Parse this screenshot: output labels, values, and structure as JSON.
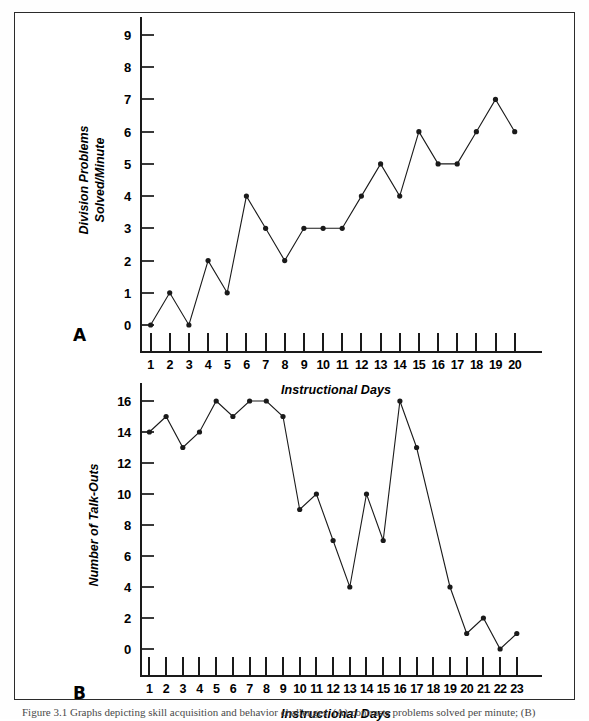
{
  "figure": {
    "caption": "Figure 3.1  Graphs depicting skill acquisition and behavior challenges. (A) contrasts problems solved per minute; (B)"
  },
  "panels": [
    {
      "letter": "A",
      "x_title": "Instructional Days",
      "y_title": "Division Problems Solved/Minute",
      "y_ticks": [
        "0",
        "1",
        "2",
        "3",
        "4",
        "5",
        "6",
        "7",
        "8",
        "9"
      ],
      "x_ticks": [
        "1",
        "2",
        "3",
        "4",
        "5",
        "6",
        "7",
        "8",
        "9",
        "10",
        "11",
        "12",
        "13",
        "14",
        "15",
        "16",
        "17",
        "18",
        "19",
        "20"
      ]
    },
    {
      "letter": "B",
      "x_title": "Instructional Days",
      "y_title": "Number of Talk-Outs",
      "y_ticks": [
        "0",
        "2",
        "4",
        "6",
        "8",
        "10",
        "12",
        "14",
        "16"
      ],
      "x_ticks": [
        "1",
        "2",
        "3",
        "4",
        "5",
        "6",
        "7",
        "8",
        "9",
        "10",
        "11",
        "12",
        "13",
        "14",
        "15",
        "16",
        "17",
        "18",
        "19",
        "20",
        "21",
        "22",
        "23"
      ]
    }
  ],
  "chart_data": [
    {
      "type": "line",
      "title": "",
      "panel": "A",
      "xlabel": "Instructional Days",
      "ylabel": "Division Problems Solved/Minute",
      "x": [
        1,
        2,
        3,
        4,
        5,
        6,
        7,
        8,
        9,
        10,
        11,
        12,
        13,
        14,
        15,
        16,
        17,
        18,
        19,
        20
      ],
      "values": [
        0,
        1,
        0,
        2,
        1,
        4,
        3,
        2,
        3,
        3,
        3,
        4,
        5,
        4,
        6,
        5,
        5,
        6,
        7,
        6
      ],
      "xlim": [
        1,
        20
      ],
      "ylim": [
        0,
        9
      ],
      "grid": false,
      "legend": "none",
      "markers": true,
      "color": "#1a1a1a"
    },
    {
      "type": "line",
      "title": "",
      "panel": "B",
      "xlabel": "Instructional Days",
      "ylabel": "Number of Talk-Outs",
      "x": [
        1,
        2,
        3,
        4,
        5,
        6,
        7,
        8,
        9,
        10,
        11,
        12,
        13,
        14,
        15,
        16,
        17,
        19,
        20,
        21,
        22,
        23
      ],
      "values": [
        14,
        15,
        13,
        14,
        16,
        15,
        16,
        16,
        15,
        9,
        10,
        7,
        4,
        10,
        7,
        16,
        13,
        4,
        1,
        2,
        0,
        1
      ],
      "xlim": [
        1,
        23
      ],
      "ylim": [
        0,
        16
      ],
      "grid": false,
      "legend": "none",
      "markers": true,
      "color": "#1a1a1a"
    }
  ]
}
